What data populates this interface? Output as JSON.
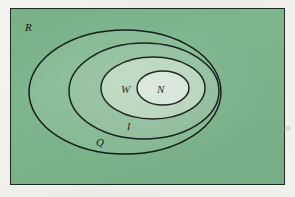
{
  "figure": {
    "type": "euler-diagram",
    "caption_text": "",
    "frame": {
      "x": 10,
      "y": 8,
      "width": 275,
      "height": 177,
      "border_color": "#1c2a22",
      "background_color": "#7eb68d"
    },
    "regions": [
      {
        "id": "R",
        "label": "R",
        "shape": "rectangle",
        "fill": "#7eb68d",
        "stroke": "#1c2a22",
        "label_x": 24,
        "label_y": 28,
        "label_size": 11
      },
      {
        "id": "Q",
        "label": "Q",
        "shape": "ellipse",
        "cx": 124,
        "cy": 91,
        "rx": 96,
        "ry": 62,
        "fill": "#88bd96",
        "stroke": "#101a14",
        "label_x": 95,
        "label_y": 142,
        "label_size": 11
      },
      {
        "id": "I",
        "label": "I",
        "shape": "ellipse",
        "cx": 143,
        "cy": 90,
        "rx": 75,
        "ry": 48,
        "fill": "#93c2a0",
        "stroke": "#101a14",
        "label_x": 124,
        "label_y": 126,
        "label_size": 10
      },
      {
        "id": "W",
        "label": "W",
        "shape": "ellipse",
        "cx": 152,
        "cy": 87,
        "rx": 52,
        "ry": 31,
        "fill": "#bcd9c0",
        "stroke": "#101a14",
        "label_x": 124,
        "label_y": 91,
        "label_size": 11
      },
      {
        "id": "N",
        "label": "N",
        "shape": "ellipse",
        "cx": 162,
        "cy": 87,
        "rx": 26,
        "ry": 17,
        "fill": "#dbeadc",
        "stroke": "#101a14",
        "label_x": 163,
        "label_y": 91,
        "label_size": 11
      }
    ],
    "labels": {
      "R": "R",
      "Q": "Q",
      "I": "I",
      "W": "W",
      "N": "N"
    },
    "colors": {
      "page": "#f4f3ef",
      "frame_border": "#1c2a22",
      "region_R": "#7eb68d",
      "region_Q": "#88bd96",
      "region_I": "#93c2a0",
      "region_W": "#bcd9c0",
      "region_N": "#dbeadc",
      "ellipse_stroke": "#101a14",
      "label_text": "#101a14"
    }
  }
}
